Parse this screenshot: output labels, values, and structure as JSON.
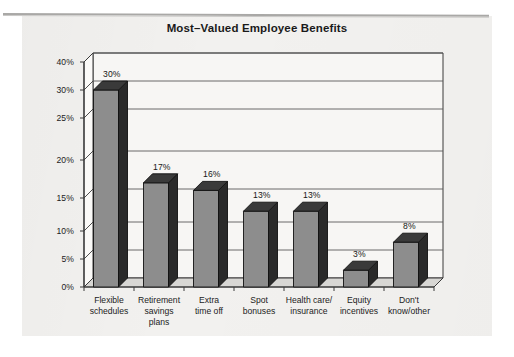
{
  "chart_data": {
    "type": "bar",
    "title": "Most–Valued Employee Benefits",
    "xlabel": "",
    "ylabel": "",
    "categories": [
      "Flexible schedules",
      "Retirement savings plans",
      "Extra time off",
      "Spot bonuses",
      "Health care/ insurance",
      "Equity incentives",
      "Don't know/other"
    ],
    "category_lines": [
      [
        "Flexible",
        "schedules"
      ],
      [
        "Retirement",
        "savings",
        "plans"
      ],
      [
        "Extra",
        "time off"
      ],
      [
        "Spot",
        "bonuses"
      ],
      [
        "Health care/",
        "insurance"
      ],
      [
        "Equity",
        "incentives"
      ],
      [
        "Don't",
        "know/other"
      ]
    ],
    "values": [
      30,
      17,
      16,
      13,
      13,
      3,
      8
    ],
    "value_labels": [
      "30%",
      "17%",
      "16%",
      "13%",
      "13%",
      "3%",
      "8%"
    ],
    "ytick_labels": [
      "40%",
      "30%",
      "25%",
      "20%",
      "15%",
      "10%",
      "5%",
      "0%"
    ],
    "ytick_values": [
      40,
      30,
      25,
      20,
      15,
      10,
      5,
      0
    ],
    "ylim": [
      0,
      40
    ],
    "grid": true,
    "legend": false,
    "style": "3d-column",
    "colors": {
      "bar_front": "#8d8d8d",
      "bar_side": "#2a2a2a",
      "bar_top": "#3a3a3a",
      "wall": "#f7f6f4",
      "floor": "#d8d7d4",
      "gridline": "#5a5a5a",
      "axis": "#3a3a3a",
      "text": "#1c1c1c",
      "page": "#f2f1ef",
      "rule": "#a9a8a6"
    }
  }
}
